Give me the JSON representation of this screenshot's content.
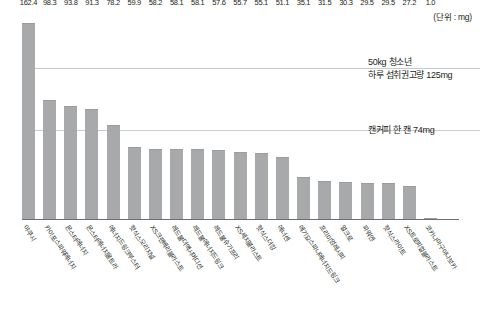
{
  "unit_note": "(단위 : mg)",
  "references": [
    {
      "name": "teen-daily-limit",
      "value": 125,
      "label_line1": "50kg 청소년",
      "label_line2": "하루 섭취권고량 125mg"
    },
    {
      "name": "canned-coffee",
      "value": 74,
      "label_line1": "캔커피 한 캔 74mg",
      "label_line2": ""
    }
  ],
  "chart_data": {
    "type": "bar",
    "title": "",
    "subtitle": "",
    "xlabel": "",
    "ylabel": "",
    "unit": "mg",
    "ylim": [
      0,
      175
    ],
    "grid": false,
    "legend": "none",
    "bar_color": "#a8a9ab",
    "reference_lines": [
      {
        "value": 125,
        "label": "50kg 청소년 하루 섭취권고량 125mg",
        "color": "#c9cacc"
      },
      {
        "value": 74,
        "label": "캔커피 한 캔 74mg",
        "color": "#c9cacc"
      }
    ],
    "categories": [
      "야쿠시",
      "카이포스파워에너지",
      "몬스터에너지",
      "몬스터에너지울트라",
      "에너지드링크부스터",
      "핫식스오리지널",
      "XS크랜베리블라스트",
      "레드불더맥시머디션",
      "레드불에너지드링크",
      "레드불슈가프리",
      "XS세지블라스트",
      "핫식스더킹",
      "에너센",
      "에기요스파나에너지드링크",
      "프리미엄레시피",
      "얼크로",
      "파워엔",
      "핫식스라이트",
      "XS트로피컬블라스트",
      "코카나아구아나보카"
    ],
    "values": [
      162.4,
      98.3,
      93.8,
      91.3,
      78.2,
      59.9,
      58.2,
      58.1,
      58.1,
      57.6,
      55.7,
      55.1,
      51.1,
      35.1,
      31.5,
      30.3,
      29.5,
      29.5,
      27.2,
      1.0
    ],
    "value_labels": [
      "162.4",
      "98.3",
      "93.8",
      "91.3",
      "78.2",
      "59.9",
      "58.2",
      "58.1",
      "58.1",
      "57.6",
      "55.7",
      "55.1",
      "51.1",
      "35.1",
      "31.5",
      "30.3",
      "29.5",
      "29.5",
      "27.2",
      "1.0"
    ]
  }
}
